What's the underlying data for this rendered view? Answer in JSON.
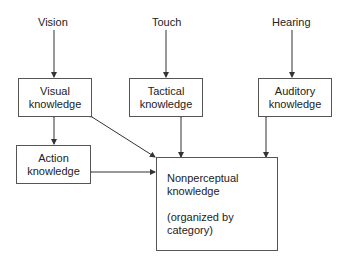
{
  "inputs": {
    "vision": "Vision",
    "touch": "Touch",
    "hearing": "Hearing"
  },
  "boxes": {
    "visual": {
      "line1": "Visual",
      "line2": "knowledge"
    },
    "tactical": {
      "line1": "Tactical",
      "line2": "knowledge"
    },
    "auditory": {
      "line1": "Auditory",
      "line2": "knowledge"
    },
    "action": {
      "line1": "Action",
      "line2": "knowledge"
    },
    "nonperceptual": {
      "line1": "Nonperceptual",
      "line2": "knowledge",
      "line3": "(organized by",
      "line4": "category)"
    }
  },
  "colors": {
    "line": "#333333",
    "box_border": "#555555",
    "text": "#222222"
  }
}
